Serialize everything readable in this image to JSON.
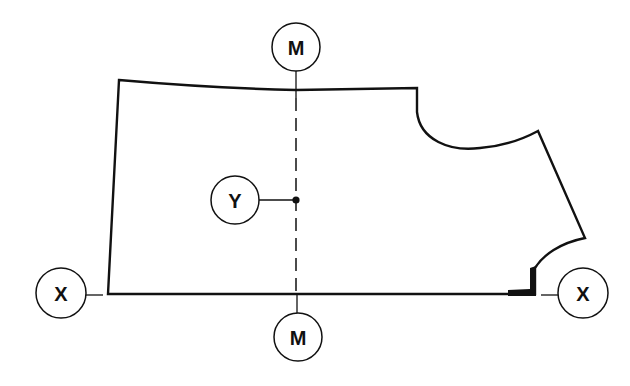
{
  "diagram": {
    "type": "pattern-piece",
    "colors": {
      "stroke": "#111111",
      "background": "#ffffff"
    },
    "labels": {
      "m_top": "M",
      "m_bottom": "M",
      "x_left": "X",
      "x_right": "X",
      "y": "Y"
    },
    "axes": {
      "vertical": "M–M (dashed centre line)",
      "horizontal": "X–X (base line)"
    },
    "point": "Y"
  }
}
